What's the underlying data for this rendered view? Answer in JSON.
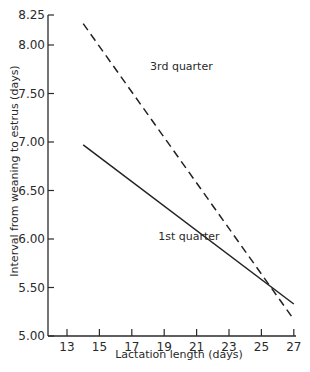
{
  "chart_data": {
    "type": "line",
    "title": "",
    "xlabel": "Lactation length (days)",
    "ylabel": "Interval from weaning to estrus (days)",
    "xlim": [
      12,
      27
    ],
    "ylim": [
      5.0,
      8.25
    ],
    "xticks": [
      13,
      15,
      17,
      19,
      21,
      23,
      25,
      27
    ],
    "yticks": [
      5.0,
      5.5,
      6.0,
      6.5,
      7.0,
      7.5,
      8.0,
      8.25
    ],
    "ytick_labels": [
      "5.00",
      "5.50",
      "6.00",
      "6.50",
      "7.00",
      "7.50",
      "8.00",
      "8.25"
    ],
    "grid": false,
    "legend": "inline labels",
    "series": [
      {
        "name": "3rd quarter",
        "style": "dashed",
        "x": [
          14,
          27
        ],
        "values": [
          8.22,
          5.17
        ]
      },
      {
        "name": "1st quarter",
        "style": "solid",
        "x": [
          14,
          27
        ],
        "values": [
          6.97,
          5.33
        ]
      }
    ],
    "annotations": [
      {
        "text": "3rd quarter",
        "x": 18.5,
        "y": 7.75
      },
      {
        "text": "1st quarter",
        "x": 19.0,
        "y": 6.0
      }
    ]
  }
}
